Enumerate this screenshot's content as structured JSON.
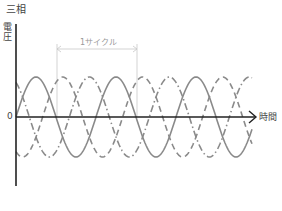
{
  "title": "三相",
  "y_axis_label": "電圧",
  "x_axis_label": "時間",
  "origin_label": "0",
  "cycle_label": "1サイクル",
  "colors": {
    "axis": "#222222",
    "wave": "#8a8a8a",
    "guide": "#c8c8c8"
  },
  "chart_data": {
    "type": "line",
    "title": "三相",
    "xlabel": "時間",
    "ylabel": "電圧",
    "series": [
      {
        "name": "phase-1",
        "style": "solid",
        "phase_deg": 0
      },
      {
        "name": "phase-2",
        "style": "dashed",
        "phase_deg": 120
      },
      {
        "name": "phase-3",
        "style": "dash-dot",
        "phase_deg": 240
      }
    ],
    "cycles_shown": 3,
    "annotation": "1サイクル"
  }
}
